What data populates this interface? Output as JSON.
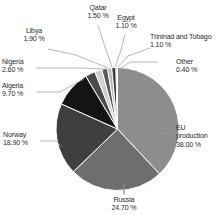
{
  "chart_data": {
    "type": "pie",
    "title": "",
    "subtitle": "",
    "xlabel": "",
    "ylabel": "",
    "legend_position": "none",
    "grid": false,
    "value_suffix": "%",
    "categories": [
      "EU production",
      "Russia",
      "Norway",
      "Algeria",
      "Nigeria",
      "Libya",
      "Qatar",
      "Egypt",
      "Trininad and Tobago",
      "Other"
    ],
    "values": [
      38.0,
      24.7,
      18.9,
      9.7,
      2.6,
      1.9,
      1.5,
      1.1,
      1.1,
      0.4
    ],
    "slices": [
      {
        "label": "EU production",
        "value": 38.0,
        "value_text": "38.00 %",
        "color": "#8d8d8d"
      },
      {
        "label": "Russia",
        "value": 24.7,
        "value_text": "24.70 %",
        "color": "#6e6e6e"
      },
      {
        "label": "Norway",
        "value": 18.9,
        "value_text": "18.90 %",
        "color": "#3f3f3f"
      },
      {
        "label": "Algeria",
        "value": 9.7,
        "value_text": "9.70 %",
        "color": "#141414"
      },
      {
        "label": "Nigeria",
        "value": 2.6,
        "value_text": "2.60 %",
        "color": "#4a4a4a"
      },
      {
        "label": "Libya",
        "value": 1.9,
        "value_text": "1.90 %",
        "color": "#cfcfcf"
      },
      {
        "label": "Qatar",
        "value": 1.5,
        "value_text": "1.50 %",
        "color": "#5a5a5a"
      },
      {
        "label": "Egypt",
        "value": 1.1,
        "value_text": "1.10 %",
        "color": "#b8b8b8"
      },
      {
        "label": "Trininad and Tobago",
        "value": 1.1,
        "value_text": "1.10 %",
        "color": "#3a3a3a"
      },
      {
        "label": "Other",
        "value": 0.4,
        "value_text": "0.40 %",
        "color": "#d8d8d8"
      }
    ],
    "colors": {
      "background": "#ffffff",
      "slice_border": "#ffffff",
      "leader_line": "#9a9a9a",
      "label_text": "#2b2b2b"
    }
  },
  "labels": {
    "eu": {
      "name": "EU",
      "name2": "production",
      "value": "38.00 %"
    },
    "russia": {
      "name": "Russia",
      "value": "24.70 %"
    },
    "norway": {
      "name": "Norway",
      "value": "18.90 %"
    },
    "algeria": {
      "name": "Algeria",
      "value": "9.70 %"
    },
    "nigeria": {
      "name": "Nigeria",
      "value": "2.60 %"
    },
    "libya": {
      "name": "Libya",
      "value": "1.90 %"
    },
    "qatar": {
      "name": "Qatar",
      "value": "1.50 %"
    },
    "egypt": {
      "name": "Egypt",
      "value": "1.10 %"
    },
    "trinidad": {
      "name": "Trininad and Tobago",
      "value": "1.10 %"
    },
    "other": {
      "name": "Other",
      "value": "0.40 %"
    }
  }
}
